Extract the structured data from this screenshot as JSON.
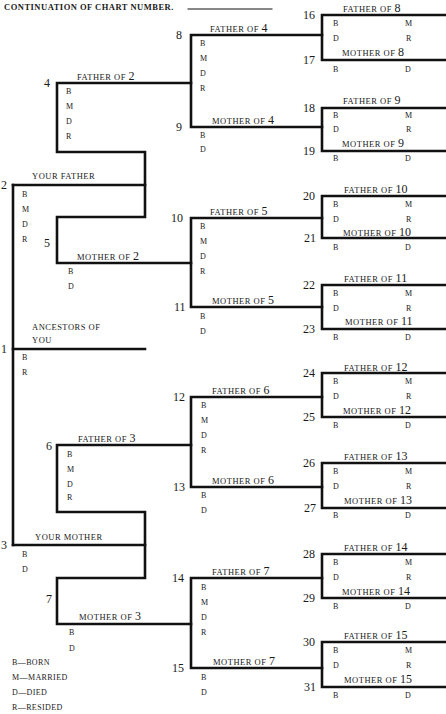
{
  "header": {
    "title": "CONTINUATION OF CHART NUMBER.",
    "chart_number_value": ""
  },
  "persons": {
    "p1": {
      "number": "1",
      "label_line1": "ANCESTORS OF",
      "label_line2": "YOU",
      "fields": [
        "B",
        "R"
      ]
    },
    "p2": {
      "number": "2",
      "label": "YOUR FATHER",
      "fields": [
        "B",
        "M",
        "D",
        "R"
      ]
    },
    "p3": {
      "number": "3",
      "label": "YOUR MOTHER",
      "fields": [
        "B",
        "D"
      ]
    },
    "p4": {
      "number": "4",
      "label": "FATHER OF",
      "of": "2",
      "fields": [
        "B",
        "M",
        "D",
        "R"
      ]
    },
    "p5": {
      "number": "5",
      "label": "MOTHER OF",
      "of": "2",
      "fields": [
        "B",
        "D"
      ]
    },
    "p6": {
      "number": "6",
      "label": "FATHER OF",
      "of": "3",
      "fields": [
        "B",
        "M",
        "D",
        "R"
      ]
    },
    "p7": {
      "number": "7",
      "label": "MOTHER OF",
      "of": "3",
      "fields": [
        "B",
        "D"
      ]
    },
    "p8": {
      "number": "8",
      "label": "FATHER OF",
      "of": "4",
      "fields": [
        "B",
        "M",
        "D",
        "R"
      ]
    },
    "p9": {
      "number": "9",
      "label": "MOTHER OF",
      "of": "4",
      "fields": [
        "B",
        "D"
      ]
    },
    "p10": {
      "number": "10",
      "label": "FATHER OF",
      "of": "5",
      "fields": [
        "B",
        "M",
        "D",
        "R"
      ]
    },
    "p11": {
      "number": "11",
      "label": "MOTHER OF",
      "of": "5",
      "fields": [
        "B",
        "D"
      ]
    },
    "p12": {
      "number": "12",
      "label": "FATHER OF",
      "of": "6",
      "fields": [
        "B",
        "M",
        "D",
        "R"
      ]
    },
    "p13": {
      "number": "13",
      "label": "MOTHER OF",
      "of": "6",
      "fields": [
        "B",
        "D"
      ]
    },
    "p14": {
      "number": "14",
      "label": "FATHER OF",
      "of": "7",
      "fields": [
        "B",
        "M",
        "D",
        "R"
      ]
    },
    "p15": {
      "number": "15",
      "label": "MOTHER OF",
      "of": "7",
      "fields": [
        "B",
        "D"
      ]
    },
    "p16": {
      "number": "16",
      "label": "FATHER OF",
      "of": "8",
      "fields": [
        "B",
        "M",
        "D",
        "R"
      ]
    },
    "p17": {
      "number": "17",
      "label": "MOTHER OF",
      "of": "8",
      "fields": [
        "B",
        "D"
      ]
    },
    "p18": {
      "number": "18",
      "label": "FATHER OF",
      "of": "9",
      "fields": [
        "B",
        "M",
        "D",
        "R"
      ]
    },
    "p19": {
      "number": "19",
      "label": "MOTHER OF",
      "of": "9",
      "fields": [
        "B",
        "D"
      ]
    },
    "p20": {
      "number": "20",
      "label": "FATHER OF",
      "of": "10",
      "fields": [
        "B",
        "M",
        "D",
        "R"
      ]
    },
    "p21": {
      "number": "21",
      "label": "MOTHER OF",
      "of": "10",
      "fields": [
        "B",
        "D"
      ]
    },
    "p22": {
      "number": "22",
      "label": "FATHER OF",
      "of": "11",
      "fields": [
        "B",
        "M",
        "D",
        "R"
      ]
    },
    "p23": {
      "number": "23",
      "label": "MOTHER OF",
      "of": "11",
      "fields": [
        "B",
        "D"
      ]
    },
    "p24": {
      "number": "24",
      "label": "FATHER OF",
      "of": "12",
      "fields": [
        "B",
        "M",
        "D",
        "R"
      ]
    },
    "p25": {
      "number": "25",
      "label": "MOTHER OF",
      "of": "12",
      "fields": [
        "B",
        "D"
      ]
    },
    "p26": {
      "number": "26",
      "label": "FATHER OF",
      "of": "13",
      "fields": [
        "B",
        "M",
        "D",
        "R"
      ]
    },
    "p27": {
      "number": "27",
      "label": "MOTHER OF",
      "of": "13",
      "fields": [
        "B",
        "D"
      ]
    },
    "p28": {
      "number": "28",
      "label": "FATHER OF",
      "of": "14",
      "fields": [
        "B",
        "M",
        "D",
        "R"
      ]
    },
    "p29": {
      "number": "29",
      "label": "MOTHER OF",
      "of": "14",
      "fields": [
        "B",
        "D"
      ]
    },
    "p30": {
      "number": "30",
      "label": "FATHER OF",
      "of": "15",
      "fields": [
        "B",
        "M",
        "D",
        "R"
      ]
    },
    "p31": {
      "number": "31",
      "label": "MOTHER OF",
      "of": "15",
      "fields": [
        "B",
        "D"
      ]
    }
  },
  "legend": [
    {
      "code": "B",
      "meaning": "BORN",
      "text": "B—BORN"
    },
    {
      "code": "M",
      "meaning": "MARRIED",
      "text": "M—MARRIED"
    },
    {
      "code": "D",
      "meaning": "DIED",
      "text": "D—DIED"
    },
    {
      "code": "R",
      "meaning": "RESIDED",
      "text": "R—RESIDED"
    }
  ],
  "colors": {
    "ink": "#1a1a1a",
    "paper": "#ffffff"
  }
}
